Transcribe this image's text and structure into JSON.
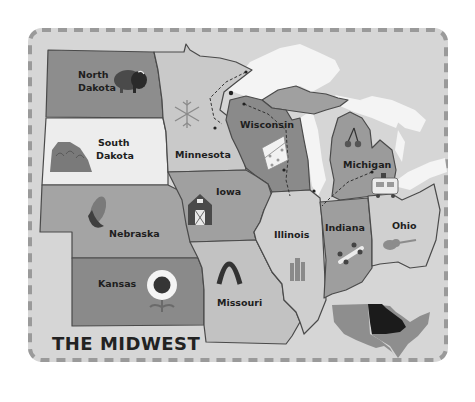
{
  "title": "THE MIDWEST",
  "colors": {
    "card_bg": "#d6d6d6",
    "card_border_dash": "#9a9a9a",
    "water": "#f4f4f4",
    "outline": "#4a4a4a",
    "label": "#1e1e1e",
    "inset_us": "#8e8e8e",
    "inset_midwest": "#1b1b1b"
  },
  "states": [
    {
      "name": "North Dakota",
      "line1": "North",
      "line2": "Dakota",
      "icon": "bison-icon",
      "fill": "#8d8d8d"
    },
    {
      "name": "South Dakota",
      "line1": "South",
      "line2": "Dakota",
      "icon": "mount-rushmore-icon",
      "fill": "#ededed"
    },
    {
      "name": "Minnesota",
      "line1": "Minnesota",
      "icon": "snowflake-icon",
      "fill": "#c9c9c9"
    },
    {
      "name": "Wisconsin",
      "line1": "Wisconsin",
      "icon": "cheese-icon",
      "fill": "#8a8a8a"
    },
    {
      "name": "Michigan",
      "line1": "Michigan",
      "icon": "cherries-icon",
      "fill": "#9b9b9b"
    },
    {
      "name": "Iowa",
      "line1": "Iowa",
      "icon": "barn-icon",
      "fill": "#a0a0a0"
    },
    {
      "name": "Nebraska",
      "line1": "Nebraska",
      "icon": "corn-icon",
      "fill": "#a4a4a4"
    },
    {
      "name": "Kansas",
      "line1": "Kansas",
      "icon": "sunflower-icon",
      "fill": "#8a8a8a"
    },
    {
      "name": "Missouri",
      "line1": "Missouri",
      "icon": "gateway-arch-icon",
      "fill": "#c2c2c2"
    },
    {
      "name": "Illinois",
      "line1": "Illinois",
      "icon": "skyline-icon",
      "fill": "#cfcfcf"
    },
    {
      "name": "Indiana",
      "line1": "Indiana",
      "icon": "race-car-icon",
      "fill": "#9e9e9e"
    },
    {
      "name": "Ohio",
      "line1": "Ohio",
      "icon": "guitar-icon",
      "fill": "#d0d0d0"
    }
  ],
  "extras": {
    "ice_cream_truck": "food-truck-icon",
    "inset_map": "us-inset-map"
  }
}
